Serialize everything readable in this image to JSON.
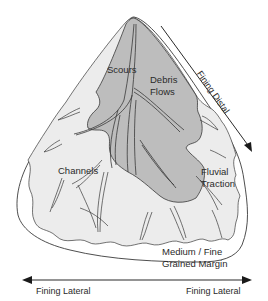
{
  "diagram": {
    "type": "alluvial fan facies diagram",
    "colors": {
      "outer_fan": "#ffffff",
      "middle_zone": "#ececec",
      "proximal_zone": "#bdbdbd",
      "outline": "#3a3a3a",
      "text": "#2a2a2a"
    },
    "labels": {
      "scours": "Scours",
      "debris_flows_line1": "Debris",
      "debris_flows_line2": "Flows",
      "channels": "Channels",
      "fluvial_traction_line1": "Fluvial",
      "fluvial_traction_line2": "Traction",
      "margin_line1": "Medium / Fine",
      "margin_line2": "Grained Margin",
      "fining_distal": "Fining Distal",
      "fining_lateral_left": "Fining Lateral",
      "fining_lateral_right": "Fining Lateral"
    },
    "arrows": {
      "distal": {
        "direction": "down-right",
        "label": "Fining Distal"
      },
      "lateral": {
        "direction": "both",
        "label_left": "Fining Lateral",
        "label_right": "Fining Lateral"
      }
    }
  }
}
